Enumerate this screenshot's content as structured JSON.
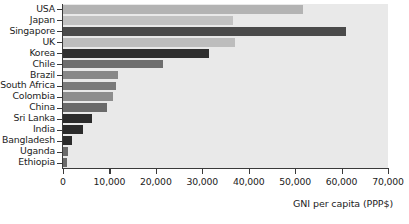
{
  "chart_data": {
    "type": "bar",
    "orientation": "horizontal",
    "title": "",
    "xlabel": "GNI per capita (PPP$)",
    "ylabel": "",
    "xlim": [
      0,
      70000
    ],
    "xticks": [
      0,
      10000,
      20000,
      30000,
      40000,
      50000,
      60000,
      70000
    ],
    "xtick_labels": [
      "0",
      "10,000",
      "20,000",
      "30,000",
      "40,000",
      "50,000",
      "60,000",
      "70,000"
    ],
    "grid": false,
    "legend": null,
    "categories": [
      "USA",
      "Japan",
      "Singapore",
      "UK",
      "Korea",
      "Chile",
      "Brazil",
      "South Africa",
      "Colombia",
      "China",
      "Sri Lanka",
      "India",
      "Bangladesh",
      "Uganda",
      "Ethiopia"
    ],
    "values": [
      51700,
      36600,
      60900,
      37000,
      31400,
      21500,
      11800,
      11400,
      10800,
      9500,
      6200,
      4300,
      1900,
      1000,
      950
    ],
    "bar_colors": [
      "#b3b3b3",
      "#c2c2c2",
      "#4a4a4a",
      "#bdbdbd",
      "#2f2f2f",
      "#6e6e6e",
      "#888888",
      "#7a7a7a",
      "#8d8d8d",
      "#6a6a6a",
      "#2b2b2b",
      "#2b2b2b",
      "#2b2b2b",
      "#6a6a6a",
      "#6a6a6a"
    ],
    "plot_background": "#e9e9e9",
    "axis_color": "#3a3a3a",
    "text_color": "#1c1c1c"
  }
}
